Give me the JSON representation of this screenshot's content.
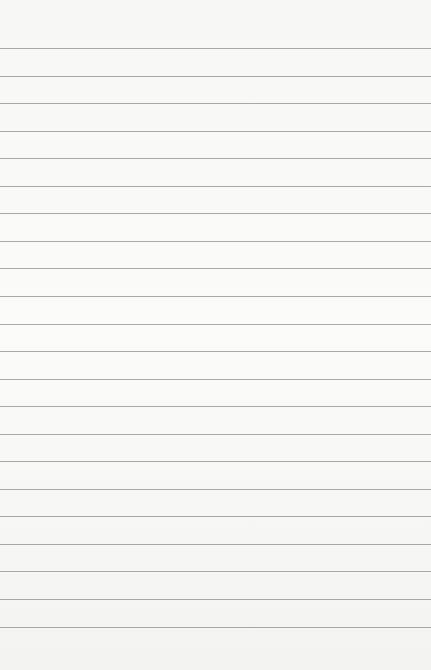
{
  "paper": {
    "type": "lined-paper",
    "line_count": 22,
    "first_line_y": 48,
    "line_spacing": 27.55,
    "line_color": "#8e8e8e",
    "background_color": "#f7f7f6"
  }
}
